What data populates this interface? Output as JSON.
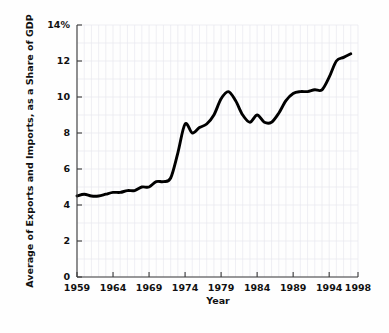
{
  "chart_data": {
    "type": "line",
    "title": "",
    "xlabel": "Year",
    "ylabel": "Average of Exports and Imports, as a Share of GDP",
    "xlim": [
      1959,
      1998
    ],
    "ylim": [
      0,
      14
    ],
    "grid": true,
    "legend": "none",
    "x_tick_labels": [
      "1959",
      "1964",
      "1969",
      "1974",
      "1979",
      "1984",
      "1989",
      "1994",
      "1998"
    ],
    "x_ticks": [
      1959,
      1964,
      1969,
      1974,
      1979,
      1984,
      1989,
      1994,
      1998
    ],
    "y_tick_labels": [
      "0",
      "2",
      "4",
      "6",
      "8",
      "10",
      "12",
      "14%"
    ],
    "y_ticks": [
      0,
      2,
      4,
      6,
      8,
      10,
      12,
      14
    ],
    "line_color": "#000000",
    "x": [
      1959,
      1960,
      1961,
      1962,
      1963,
      1964,
      1965,
      1966,
      1967,
      1968,
      1969,
      1970,
      1971,
      1972,
      1973,
      1974,
      1975,
      1976,
      1977,
      1978,
      1979,
      1980,
      1981,
      1982,
      1983,
      1984,
      1985,
      1986,
      1987,
      1988,
      1989,
      1990,
      1991,
      1992,
      1993,
      1994,
      1995,
      1996,
      1997
    ],
    "values": [
      4.5,
      4.6,
      4.5,
      4.5,
      4.6,
      4.7,
      4.7,
      4.8,
      4.8,
      5.0,
      5.0,
      5.3,
      5.3,
      5.5,
      6.9,
      8.5,
      8.0,
      8.3,
      8.5,
      9.0,
      9.9,
      10.3,
      9.8,
      9.0,
      8.6,
      9.0,
      8.6,
      8.6,
      9.1,
      9.8,
      10.2,
      10.3,
      10.3,
      10.4,
      10.4,
      11.1,
      12.0,
      12.2,
      12.4
    ],
    "series_name": "Average of Exports and Imports as Share of GDP"
  },
  "axis": {
    "y_title": "Average of Exports and Imports, as a Share of GDP",
    "x_title": "Year"
  }
}
